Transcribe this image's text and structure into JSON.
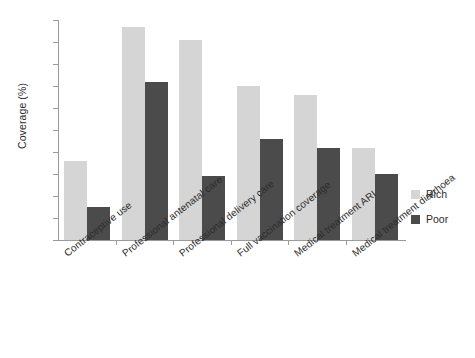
{
  "chart_data": {
    "type": "bar",
    "title": "",
    "xlabel": "",
    "ylabel": "Coverage (%)",
    "ylim": [
      0,
      100
    ],
    "ytick_step": 10,
    "grid": false,
    "legend_position": "right",
    "categories": [
      "Contraceptive use",
      "Professional antenatal care",
      "Professional delivery care",
      "Full vaccination coverage",
      "Medical treatment ARI",
      "Medical treatment diarrhoea"
    ],
    "yticks": [
      "0",
      "10",
      "20",
      "30",
      "40",
      "50",
      "60",
      "70",
      "80",
      "90",
      "100"
    ],
    "series": [
      {
        "name": "Rich",
        "color": "#d5d5d5",
        "values": [
          36,
          97,
          91,
          70,
          66,
          42
        ]
      },
      {
        "name": "Poor",
        "color": "#4b4b4b",
        "values": [
          15,
          72,
          29,
          46,
          42,
          30
        ]
      }
    ]
  },
  "legend": {
    "items": [
      {
        "label": "Rich"
      },
      {
        "label": "Poor"
      }
    ]
  }
}
